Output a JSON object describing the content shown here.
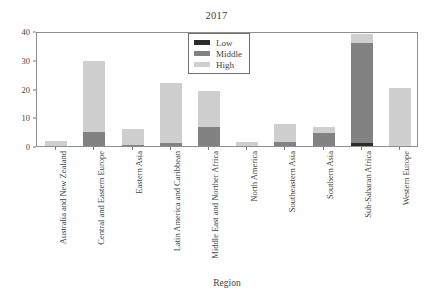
{
  "chart_data": {
    "type": "bar",
    "subtype": "stacked-bar",
    "title": "2017",
    "xlabel": "Region",
    "ylabel": "",
    "ylim": [
      0,
      40
    ],
    "yticks": [
      0,
      10,
      20,
      30,
      40
    ],
    "grid": false,
    "legend_position": "top-center-inside",
    "legend_entries": [
      "Low",
      "Middle",
      "High"
    ],
    "categories": [
      "Australia and New Zealand",
      "Central and Eastern Europe",
      "Eastern Asia",
      "Latin America and Caribbean",
      "Middle East and Norther Africa",
      "North America",
      "Southeastern Asia",
      "Southern Asia",
      "Sub-Saharan Africa",
      "Western Europe"
    ],
    "series": [
      {
        "name": "Low",
        "color": "#2b2b2b",
        "values": [
          0,
          0,
          0,
          0,
          0,
          0,
          0,
          0,
          1,
          0
        ]
      },
      {
        "name": "Middle",
        "color": "#828282",
        "values": [
          0,
          5,
          0.3,
          1,
          6.5,
          0,
          1.3,
          4.5,
          35,
          0
        ]
      },
      {
        "name": "High",
        "color": "#cfcfcf",
        "values": [
          1.7,
          24.5,
          5.7,
          21,
          12.5,
          1.5,
          6.2,
          2,
          3,
          20.2
        ]
      }
    ],
    "totals": [
      1.7,
      29.5,
      6,
      22,
      19,
      1.5,
      7.5,
      6.5,
      39,
      20.2
    ]
  },
  "colors": {
    "low": "#2b2b2b",
    "middle": "#828282",
    "high": "#cfcfcf",
    "axis": "#8e8e8e",
    "text": "#3f3f3f",
    "background": "#ffffff"
  }
}
